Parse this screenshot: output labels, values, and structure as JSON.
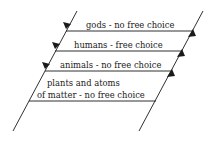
{
  "diagram": {
    "levels": [
      {
        "label": "gods - no free choice"
      },
      {
        "label": "humans - free choice"
      },
      {
        "label": "animals - no free choice"
      },
      {
        "label_line1": "plants and atoms",
        "label_line2": "of matter - no free choice"
      }
    ],
    "colors": {
      "line": "#1a1a1a",
      "text": "#222222",
      "background": "#ffffff"
    }
  }
}
